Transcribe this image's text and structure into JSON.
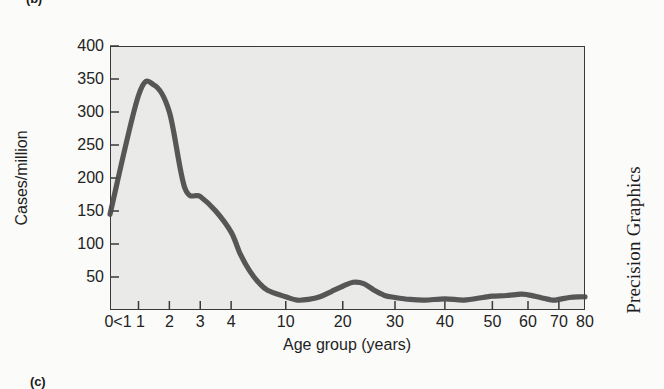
{
  "page": {
    "panel_letter_top": "(b)",
    "panel_letter_bottom": "(c)",
    "credit": "Precision Graphics"
  },
  "chart_data": {
    "type": "line",
    "title": "",
    "xlabel": "Age group (years)",
    "ylabel": "Cases/million",
    "ylim": [
      0,
      400
    ],
    "yticks": [
      50,
      100,
      150,
      200,
      250,
      300,
      350,
      400
    ],
    "xticklabels": [
      "0<1",
      "1",
      "2",
      "3",
      "4",
      "10",
      "20",
      "30",
      "40",
      "50",
      "60",
      "70",
      "80"
    ],
    "x_scale": "compressed-ordinal",
    "grid": false,
    "legend": null,
    "series": [
      {
        "name": "Cases per million",
        "x": [
          "0<1",
          "1",
          "1.5",
          "2",
          "2.5",
          "3",
          "3.5",
          "4",
          "5",
          "6",
          "7",
          "8",
          "10",
          "12",
          "14",
          "16",
          "18",
          "20",
          "22",
          "24",
          "26",
          "28",
          "30",
          "33",
          "36",
          "40",
          "44",
          "48",
          "50",
          "54",
          "58",
          "60",
          "64",
          "68",
          "70",
          "74",
          "78",
          "80"
        ],
        "values": [
          145,
          325,
          341,
          300,
          185,
          172,
          150,
          118,
          85,
          60,
          42,
          30,
          20,
          15,
          16,
          20,
          28,
          36,
          42,
          40,
          30,
          22,
          19,
          16,
          15,
          17,
          15,
          19,
          21,
          22,
          24,
          23,
          19,
          15,
          16,
          19,
          20,
          20
        ]
      }
    ],
    "annotations": {
      "peak_value": 341,
      "peak_age": "1-2",
      "secondary_peak_value": 42,
      "secondary_peak_age": "22"
    },
    "line_color": "#4a4a4a",
    "plot_background": "#efefed",
    "axis_color": "#3a3a3a"
  }
}
